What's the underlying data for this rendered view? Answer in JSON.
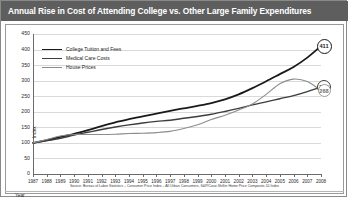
{
  "title": "Annual Rise in Cost of Attending College vs. Other Large Family Expenditures",
  "source": "Source: Bureau of Labor Statistics – Consumer Price Index – All Urban Consumers, S&P/Case-Shiller Home Price Composite-10 Index",
  "colors": {
    "title_bar": "#5e5e5e",
    "tuition": "#1a1a1a",
    "medical": "#3d3d3d",
    "housing": "#8c8c8c",
    "grid": "#d9d9d9",
    "axis": "#6b6b6b"
  },
  "legend": {
    "position": "top-left",
    "entries": [
      {
        "label": "College Tuition and Fees",
        "color": "#1a1a1a",
        "width": 1.8
      },
      {
        "label": "Medical Care Costs",
        "color": "#3d3d3d",
        "width": 1.4
      },
      {
        "label": "House Prices",
        "color": "#8c8c8c",
        "width": 1.1
      }
    ]
  },
  "endpoints": [
    {
      "name": "tuition",
      "value": "411",
      "color": "#1a1a1a",
      "text_color": "#1a1a1a"
    },
    {
      "name": "medical",
      "value": "280",
      "color": "#3d3d3d",
      "text_color": "#1a1a1a"
    },
    {
      "name": "housing",
      "value": "268",
      "color": "#9a9a9a",
      "text_color": "#6e6e6e"
    }
  ],
  "chart_data": {
    "type": "line",
    "title": "Annual Rise in Cost of Attending College vs. Other Large Family Expenditures",
    "xlabel": "Year",
    "ylabel": "Index",
    "xlim": [
      1987,
      2008
    ],
    "ylim": [
      0,
      450
    ],
    "yticks": [
      0,
      50,
      100,
      150,
      200,
      250,
      300,
      350,
      400,
      450
    ],
    "grid": true,
    "x": [
      1987,
      1988,
      1989,
      1990,
      1991,
      1992,
      1993,
      1994,
      1995,
      1996,
      1997,
      1998,
      1999,
      2000,
      2001,
      2002,
      2003,
      2004,
      2005,
      2006,
      2007,
      2008
    ],
    "series": [
      {
        "name": "College Tuition and Fees",
        "color": "#1a1a1a",
        "values": [
          100,
          109,
          119,
          129,
          141,
          154,
          166,
          176,
          185,
          194,
          203,
          211,
          219,
          228,
          240,
          256,
          276,
          298,
          321,
          344,
          374,
          411
        ]
      },
      {
        "name": "Medical Care Costs",
        "color": "#3d3d3d",
        "values": [
          100,
          107,
          115,
          125,
          134,
          143,
          151,
          158,
          164,
          169,
          173,
          179,
          185,
          192,
          201,
          211,
          222,
          232,
          242,
          252,
          265,
          280
        ]
      },
      {
        "name": "House Prices",
        "color": "#8c8c8c",
        "values": [
          100,
          111,
          122,
          127,
          127,
          127,
          128,
          130,
          131,
          133,
          137,
          146,
          158,
          175,
          189,
          206,
          225,
          256,
          290,
          305,
          297,
          268
        ]
      }
    ]
  }
}
